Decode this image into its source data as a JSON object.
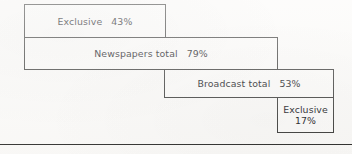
{
  "figure": {
    "type": "overlapping-bar-diagram",
    "background_color": "#fbfaf8",
    "line_color": "#3a3a38",
    "text_color": "#16161a"
  },
  "bars": [
    {
      "id": "exclusive-print",
      "label": "Exclusive",
      "value": "43%",
      "value_number": 43,
      "layout": "inline"
    },
    {
      "id": "newspapers-total",
      "label": "Newspapers total",
      "value": "79%",
      "value_number": 79,
      "layout": "inline"
    },
    {
      "id": "broadcast-total",
      "label": "Broadcast total",
      "value": "53%",
      "value_number": 53,
      "layout": "inline"
    },
    {
      "id": "exclusive-broadcast",
      "label": "Exclusive",
      "value": "17%",
      "value_number": 17,
      "layout": "stacked"
    }
  ],
  "chart_data": {
    "type": "bar",
    "title": "",
    "xlabel": "",
    "ylabel": "",
    "orientation": "horizontal",
    "categories": [
      "Exclusive",
      "Newspapers total",
      "Broadcast total",
      "Exclusive"
    ],
    "values": [
      43,
      79,
      53,
      17
    ],
    "value_labels": [
      "43%",
      "79%",
      "53%",
      "17%"
    ],
    "xlim": [
      0,
      100
    ],
    "grid": false,
    "legend": null,
    "annotations": [
      "Bars are drawn as nested/offset rectangles showing overlap between newspaper and broadcast audiences.",
      "Horizontal rule below the diagram."
    ]
  }
}
